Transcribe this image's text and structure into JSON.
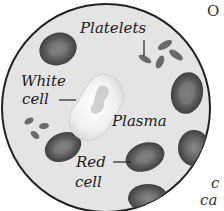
{
  "diagram": {
    "labels": {
      "platelets": "Platelets",
      "white_cell_line1": "White",
      "white_cell_line2": "cell",
      "plasma": "Plasma",
      "red_cell_line1": "Red",
      "red_cell_line2": "cell"
    },
    "edge_text": {
      "top_right": "O",
      "bottom_right_1": "c",
      "bottom_right_2": "ca"
    },
    "colors": {
      "background": "#ffffff",
      "plasma_fill": "#e6e6e6",
      "circle_outline": "#222222",
      "red_cell_fill": "#5a5a5a",
      "red_cell_center": "#7a7a7a",
      "white_cell_fill": "#f4f4f4",
      "platelet_fill": "#6a6a6a"
    }
  }
}
